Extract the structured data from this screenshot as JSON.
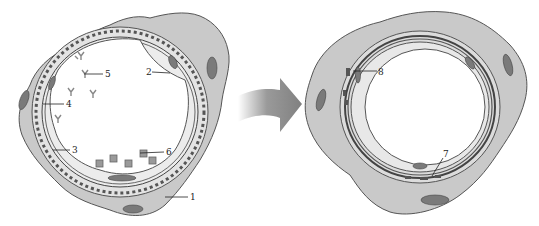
{
  "diagram": {
    "panels": [
      {
        "id": "before",
        "description": "Cross-section with microvilli-lined outer cell layer and receptors in lumen",
        "labels": [
          {
            "text": "1",
            "x": 190,
            "y": 199
          },
          {
            "text": "2",
            "x": 147,
            "y": 73
          },
          {
            "text": "3",
            "x": 72,
            "y": 151
          },
          {
            "text": "4",
            "x": 66,
            "y": 106
          },
          {
            "text": "5",
            "x": 105,
            "y": 76
          },
          {
            "text": "6",
            "x": 166,
            "y": 154
          }
        ]
      },
      {
        "id": "after",
        "description": "Cross-section after change: thickened multilayered wall, flattened outer cells",
        "labels": [
          {
            "text": "7",
            "x": 444,
            "y": 156
          },
          {
            "text": "8",
            "x": 379,
            "y": 74
          }
        ]
      }
    ],
    "arrow": {
      "direction": "right",
      "style": "curved-gradient"
    },
    "colors": {
      "cell_fill": "#c9c9c9",
      "nucleus_fill": "#7a7a7a",
      "outline": "#555555",
      "inner_fill": "#e6e6e6",
      "arrow_fill": "#8a8a8a"
    }
  }
}
